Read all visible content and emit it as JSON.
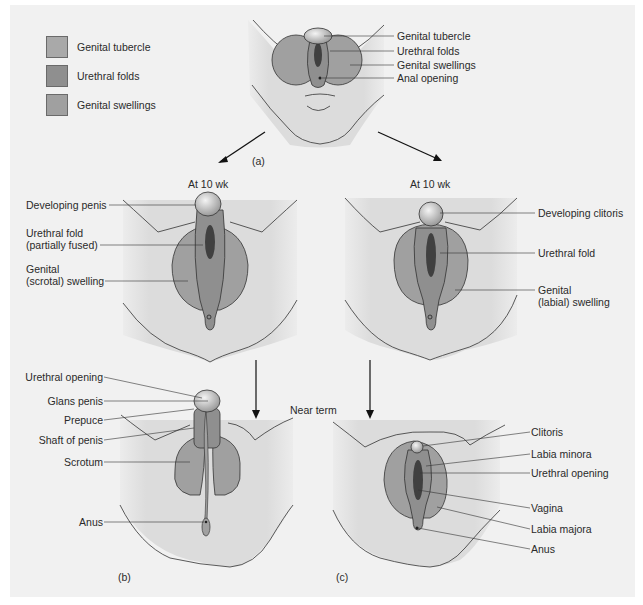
{
  "legend": {
    "items": [
      {
        "label": "Genital tubercle",
        "color": "#a9a9a9"
      },
      {
        "label": "Urethral folds",
        "color": "#8f8f8f"
      },
      {
        "label": "Genital swellings",
        "color": "#a0a0a0"
      }
    ]
  },
  "panel_a": {
    "tag": "(a)",
    "labels": [
      "Genital tubercle",
      "Urethral folds",
      "Genital swellings",
      "Anal opening"
    ]
  },
  "male_10wk": {
    "title": "At 10 wk",
    "labels": [
      "Developing penis",
      "Urethral fold",
      "(partially fused)",
      "Genital",
      "(scrotal) swelling"
    ]
  },
  "female_10wk": {
    "title": "At 10 wk",
    "labels": [
      "Developing clitoris",
      "Urethral fold",
      "Genital",
      "(labial) swelling"
    ]
  },
  "near_term": {
    "title": "Near term"
  },
  "panel_b": {
    "tag": "(b)",
    "labels": [
      "Urethral opening",
      "Glans penis",
      "Prepuce",
      "Shaft of penis",
      "Scrotum",
      "Anus"
    ]
  },
  "panel_c": {
    "tag": "(c)",
    "labels": [
      "Clitoris",
      "Labia minora",
      "Urethral opening",
      "Vagina",
      "Labia majora",
      "Anus"
    ]
  },
  "colors": {
    "background": "#f2f2f2",
    "body_skin": "#dedede",
    "swelling": "#a0a0a0",
    "fold": "#8f8f8f",
    "tubercle": "#c8c8c8",
    "slit": "#404040",
    "line": "#333333"
  }
}
